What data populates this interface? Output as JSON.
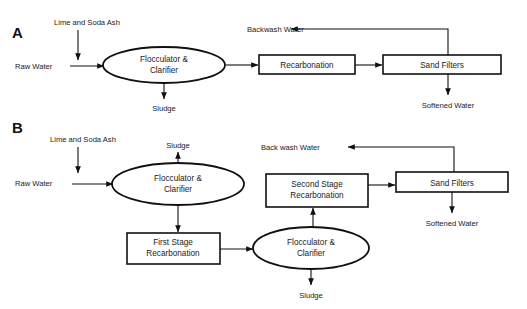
{
  "figure": {
    "panels": [
      {
        "letter": "A",
        "nodes": [
          {
            "id": "a-flocculator",
            "kind": "ellipse",
            "lines": [
              "Flocculator &",
              "Clarifier"
            ]
          },
          {
            "id": "a-recarbonation",
            "kind": "box",
            "lines": [
              "Recarbonation"
            ]
          },
          {
            "id": "a-sand-filters",
            "kind": "box",
            "lines": [
              "Sand Filters"
            ]
          }
        ],
        "labels": [
          {
            "id": "a-lime-soda-ash",
            "text": "Lime and Soda Ash"
          },
          {
            "id": "a-raw-water",
            "text": "Raw Water"
          },
          {
            "id": "a-sludge",
            "text": "Sludge"
          },
          {
            "id": "a-backwash-water",
            "text": "Backwash Water"
          },
          {
            "id": "a-softened-water",
            "text": "Softened Water"
          }
        ]
      },
      {
        "letter": "B",
        "nodes": [
          {
            "id": "b-flocculator-1",
            "kind": "ellipse",
            "lines": [
              "Flocculator &",
              "Clarifier"
            ]
          },
          {
            "id": "b-first-stage-recarbonation",
            "kind": "box",
            "lines": [
              "First Stage",
              "Recarbonation"
            ]
          },
          {
            "id": "b-flocculator-2",
            "kind": "ellipse",
            "lines": [
              "Flocculator &",
              "Clarifier"
            ]
          },
          {
            "id": "b-second-stage-recarbonation",
            "kind": "box",
            "lines": [
              "Second Stage",
              "Recarbonation"
            ]
          },
          {
            "id": "b-sand-filters",
            "kind": "box",
            "lines": [
              "Sand Filters"
            ]
          }
        ],
        "labels": [
          {
            "id": "b-lime-soda-ash",
            "text": "Lime and Soda Ash"
          },
          {
            "id": "b-raw-water",
            "text": "Raw Water"
          },
          {
            "id": "b-sludge-top",
            "text": "Sludge"
          },
          {
            "id": "b-sludge-bottom",
            "text": "Sludge"
          },
          {
            "id": "b-back-wash-water",
            "text": "Back wash Water"
          },
          {
            "id": "b-softened-water",
            "text": "Softened Water"
          }
        ]
      }
    ],
    "colors": {
      "stroke": "#111111",
      "fill": "#ffffff",
      "text": "#1a1a1a"
    }
  }
}
